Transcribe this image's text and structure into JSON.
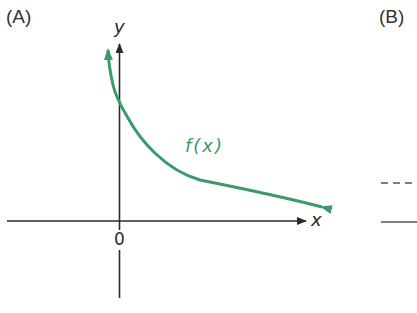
{
  "panels": {
    "a": {
      "label": "(A)"
    },
    "b": {
      "label": "(B)"
    }
  },
  "axes": {
    "x_label": "x",
    "y_label": "y",
    "origin_label": "0"
  },
  "function": {
    "label": "f(x)",
    "color": "#3a9a6a",
    "description": "Decreasing curve with vertical asymptote near y-axis and horizontal asymptote near x-axis"
  },
  "panel_b_lines": {
    "dashed": "asymptote line (dashed)",
    "solid": "axis line (solid)"
  },
  "colors": {
    "axis": "#2a2a2a",
    "curve": "#3a9a6a",
    "text": "#333333"
  }
}
